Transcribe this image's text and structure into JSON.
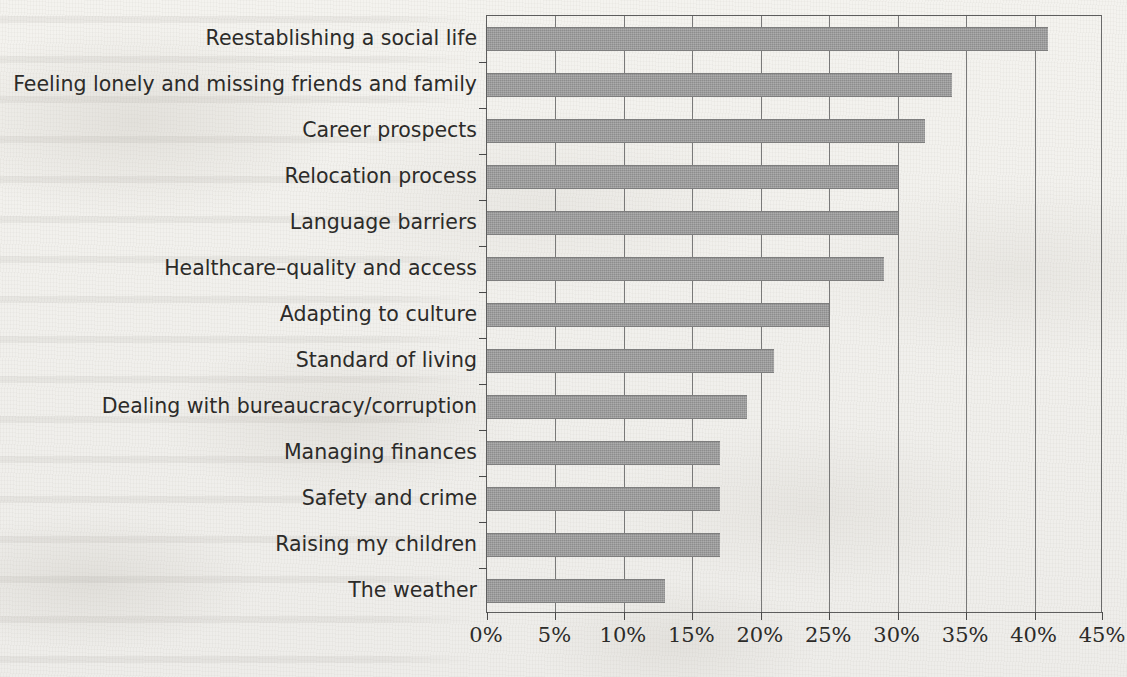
{
  "chart_data": {
    "type": "bar",
    "orientation": "horizontal",
    "title": "",
    "xlabel": "",
    "ylabel": "",
    "xlim": [
      0,
      45
    ],
    "xtick_step": 5,
    "grid": true,
    "legend": "none",
    "value_suffix": "%",
    "categories": [
      "Reestablishing a social life",
      "Feeling lonely and missing friends and family",
      "Career prospects",
      "Relocation process",
      "Language barriers",
      "Healthcare–quality and access",
      "Adapting to culture",
      "Standard of living",
      "Dealing with bureaucracy/corruption",
      "Managing finances",
      "Safety and crime",
      "Raising my children",
      "The weather"
    ],
    "values": [
      41,
      34,
      32,
      30,
      30,
      29,
      25,
      21,
      19,
      17,
      17,
      17,
      13
    ],
    "xticklabels": [
      "0%",
      "5%",
      "10%",
      "15%",
      "20%",
      "25%",
      "30%",
      "35%",
      "40%",
      "45%"
    ],
    "xtickvalues": [
      0,
      5,
      10,
      15,
      20,
      25,
      30,
      35,
      40,
      45
    ],
    "bar_color": "#8d8d8d",
    "axis_color": "#4a4a4a",
    "grid_color": "#6f6f6f",
    "text_color": "#2c2b29",
    "background_color": "#f3f2ee"
  }
}
